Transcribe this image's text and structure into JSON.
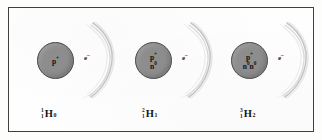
{
  "figure": {
    "border_color": "#3f3f3f",
    "background_color": "#fefefe",
    "nucleus_color": "#8d8d8d",
    "orbital_color": "#b9b9b9"
  },
  "atoms": [
    {
      "name": "protium",
      "nucleus_lines": [
        {
          "particle": "p",
          "charge": "+",
          "count_text": "p"
        }
      ],
      "nucleus_text_1": "p",
      "nucleus_sup_1": "+",
      "nucleus_text_2": "",
      "nucleus_sup_2": "",
      "electron_text": "e",
      "electron_sup": "–",
      "label": {
        "mass_number": "1",
        "atomic_number": "1",
        "symbol": "H",
        "subscript": "0"
      }
    },
    {
      "name": "deuterium",
      "nucleus_text_1": "p",
      "nucleus_sup_1": "+",
      "nucleus_text_2": "n",
      "nucleus_sup_2": "0",
      "electron_text": "e",
      "electron_sup": "–",
      "label": {
        "mass_number": "2",
        "atomic_number": "1",
        "symbol": "H",
        "subscript": "1"
      }
    },
    {
      "name": "tritium",
      "nucleus_text_1": "p",
      "nucleus_sup_1": "+",
      "nucleus_text_2": "n",
      "nucleus_sup_2": "0",
      "nucleus_text_3": "n",
      "nucleus_sup_3": "0",
      "electron_text": "e",
      "electron_sup": "–",
      "label": {
        "mass_number": "3",
        "atomic_number": "1",
        "symbol": "H",
        "subscript": "2"
      }
    }
  ]
}
